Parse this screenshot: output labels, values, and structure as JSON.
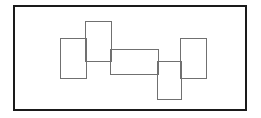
{
  "figure": {
    "canvas": {
      "width": 261,
      "height": 118,
      "background_color": "#ffffff"
    },
    "frame": {
      "name": "outer-border",
      "x": 14,
      "y": 6,
      "width": 232,
      "height": 104,
      "stroke_color": "#1a1a1a",
      "stroke_width": 2,
      "fill_color": "#ffffff"
    },
    "shape_style": {
      "stroke_color": "#707070",
      "stroke_width": 1,
      "fill": "none"
    },
    "shapes": [
      {
        "id": "rect-1",
        "label": "left vertical rectangle",
        "orientation": "portrait",
        "x": 60,
        "y": 38,
        "width": 26,
        "height": 40
      },
      {
        "id": "rect-2",
        "label": "upper tall rectangle",
        "orientation": "portrait",
        "x": 85,
        "y": 21,
        "width": 26,
        "height": 40
      },
      {
        "id": "rect-3",
        "label": "center horizontal rectangle",
        "orientation": "landscape",
        "x": 110,
        "y": 49,
        "width": 48,
        "height": 25
      },
      {
        "id": "rect-4",
        "label": "lower right vertical rectangle",
        "orientation": "portrait",
        "x": 157,
        "y": 61,
        "width": 24,
        "height": 38
      },
      {
        "id": "rect-5",
        "label": "right vertical rectangle",
        "orientation": "portrait",
        "x": 180,
        "y": 38,
        "width": 26,
        "height": 40
      }
    ]
  }
}
